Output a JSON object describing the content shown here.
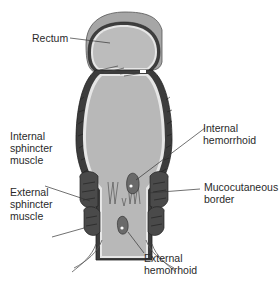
{
  "diagram": {
    "labels": {
      "rectum": "Rectum",
      "internal_sphincter": "Internal\nsphincter\nmuscle",
      "external_sphincter": "External\nsphincter\nmuscle",
      "internal_hemorrhoid": "Internal\nhemorrhoid",
      "mucocutaneous_border": "Mucocutaneous\nborder",
      "external_hemorrhoid": "External\nhemorrhoid"
    },
    "colors": {
      "lumen": "#b8b8b8",
      "outer_wall": "#9a9a9a",
      "muscle": "#4a4a4a",
      "lining": "#e8e8e8",
      "hemorrhoid": "#6a6a6a",
      "leader_line": "#333333"
    }
  }
}
